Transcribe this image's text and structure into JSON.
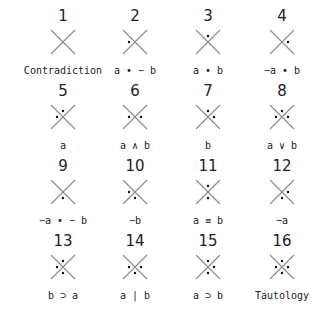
{
  "diagram": {
    "title_partial": "' '",
    "line_color": "#8a8a8a",
    "dot_color": "#111111",
    "dot_positions_legend": [
      "top",
      "left",
      "right",
      "bottom"
    ],
    "cells": [
      {
        "number": "1",
        "label": "Contradiction",
        "dots": []
      },
      {
        "number": "2",
        "label": "a • − b",
        "dots": [
          "left"
        ]
      },
      {
        "number": "3",
        "label": "a • b",
        "dots": [
          "top"
        ]
      },
      {
        "number": "4",
        "label": "−a • b",
        "dots": [
          "right"
        ]
      },
      {
        "number": "5",
        "label": "a",
        "dots": [
          "top",
          "left"
        ]
      },
      {
        "number": "6",
        "label": "a ∧ b",
        "dots": [
          "left",
          "right"
        ]
      },
      {
        "number": "7",
        "label": "b",
        "dots": [
          "top",
          "right"
        ]
      },
      {
        "number": "8",
        "label": "a ∨ b",
        "dots": [
          "top",
          "left",
          "right"
        ]
      },
      {
        "number": "9",
        "label": "−a • − b",
        "dots": [
          "bottom"
        ]
      },
      {
        "number": "10",
        "label": "−b",
        "dots": [
          "left",
          "bottom"
        ]
      },
      {
        "number": "11",
        "label": "a ≡ b",
        "dots": [
          "top",
          "bottom"
        ]
      },
      {
        "number": "12",
        "label": "−a",
        "dots": [
          "right",
          "bottom"
        ]
      },
      {
        "number": "13",
        "label": "b ⊃ a",
        "dots": [
          "top",
          "left",
          "bottom"
        ]
      },
      {
        "number": "14",
        "label": "a | b",
        "dots": [
          "left",
          "right",
          "bottom"
        ]
      },
      {
        "number": "15",
        "label": "a ⊃ b",
        "dots": [
          "top",
          "right",
          "bottom"
        ]
      },
      {
        "number": "16",
        "label": "Tautology",
        "dots": [
          "top",
          "left",
          "right",
          "bottom"
        ]
      }
    ]
  }
}
